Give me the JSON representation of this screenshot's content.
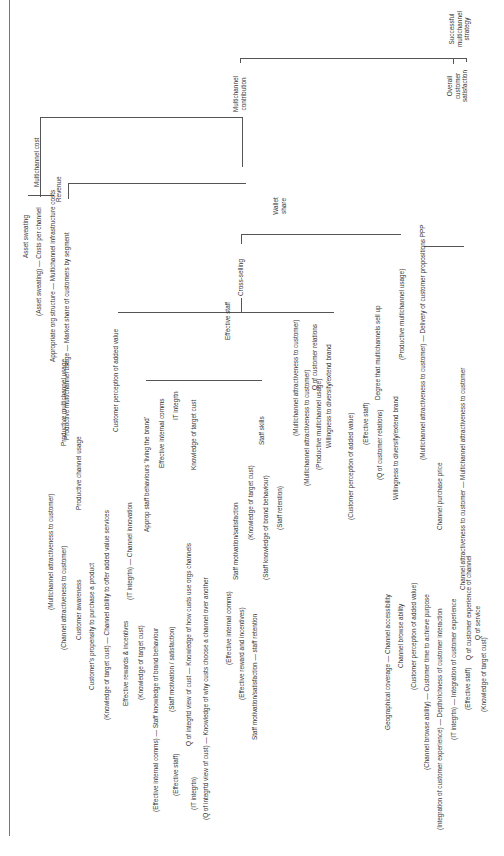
{
  "diagram": {
    "root": "Successful multichannel strategy",
    "level1": {
      "contribution": "Multichannel contribution",
      "satisfaction": "Overall customer satisfaction"
    },
    "cost": {
      "label": "Multichannel cost",
      "asset_sweating": "Asset sweating",
      "costs_per_channel": "(Asset sweating) — Costs per channel",
      "infra": "Appropriate org structure — Multichannel infrastructure costs"
    },
    "revenue": {
      "label": "Revenue",
      "market_share": "Productive multichannel usage — Market share of customers by segment",
      "wallet_share": "Wallet share"
    },
    "productive_usage": {
      "label": "Productive multichannel usage",
      "mc_attr": "(Multichannel attractiveness to customer)",
      "channel_usage": "Productive channel usage",
      "ch_attr": "(Channel attractiveness to customer)",
      "awareness": "Customer awareness",
      "propensity": "Customer's propensity to purchase a product"
    },
    "cross_selling": {
      "label": "Cross-selling",
      "cust_perception": "Customer perception of added value",
      "ability": "(Knowledge of target cust) — Channel ability to offer added value services",
      "innovation": "(IT integrtn) — Channel innovation",
      "effective_staff": "Effective staff",
      "mc_attr": "(Multichannel attractiveness to customer)",
      "q_relations": "Q of customer relations",
      "q_rel_a": "(Multichannel attractiveness to customer)",
      "q_rel_b": "(Productive multichannel usage)",
      "willingness": "Willingness to diversify/extend brand"
    },
    "effective_staff": {
      "living_brand": "Approp staff behaviours 'living the brand'",
      "rewards": "Effective rewards & incentives",
      "kn_target": "(Knowledge of target cust)",
      "kn_brand": "(Effective internal comms) — Staff knowledge of brand behaviour",
      "motivation": "(Staff motivation / satisfaction)",
      "internal_comms": "Effective internal comms",
      "it_integr": "IT integrtn",
      "knowledge_target": "Knowledge of target cust",
      "kn_orgs": "Q of integrtd view of cust — Knowledge of how custs use orgs channels",
      "kn_why": "(Q of integrtd view of cust) — Knowledge of why custs choose a channel over another",
      "eff_staff": "(Effective staff)",
      "it_int2": "(IT integrtn)",
      "motivation2": "Staff motivation/satisfaction",
      "eff_comms": "(Effective internal comms)",
      "eff_reward": "(Effective reward and incentives)",
      "retention": "Staff motivation/satisfaction — staff retention",
      "skills": "Staff skills",
      "sk_target": "(Knowledge of target cust)",
      "sk_brand": "(Staff knowledge of brand behaviour)",
      "sk_retention": "(Staff retention)"
    },
    "sell_up": {
      "label": "Degree that multichannels sell up",
      "perception": "(Customer perception of added value)",
      "eff_staff": "(Effective staff)",
      "q_rel": "(Q of customer relations)",
      "willingness": "Willingness to diversify/extend brand",
      "productive": "(Productive multichannel usage)"
    },
    "satisfaction": {
      "ppp": "(Multichannel attractiveness to customer) — Delivery of customer propositions PPP",
      "mc_attr": "Channel attractiveness to customer — Multichannel attractiveness to customer",
      "purchase_price": "Channel purchase price",
      "q_experience": "Q of customer experience of channel",
      "geo": "Geographical coverage — Channel accessibility",
      "browse": "Channel browse ability",
      "perception": "(Customer perception of added value)",
      "time": "(Channel browse ability) — Customer time to achieve purpose",
      "depth": "(Integration of customer experience) — Depth/richness of customer interaction",
      "integration": "(IT integrtn) — Integration of customer experience",
      "q_service": "Q of service",
      "eff_staff": "(Effective staff)",
      "kn_target": "(Knowledge of target cust)"
    }
  }
}
